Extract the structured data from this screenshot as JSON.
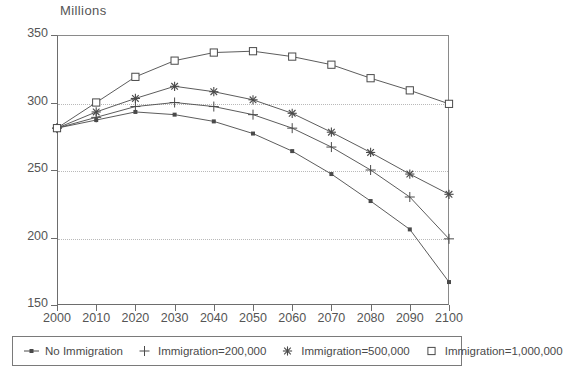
{
  "chart_data": {
    "type": "line",
    "title": "",
    "ylabel": "Millions",
    "xlabel": "",
    "x": [
      2000,
      2010,
      2020,
      2030,
      2040,
      2050,
      2060,
      2070,
      2080,
      2090,
      2100
    ],
    "xlim": [
      2000,
      2100
    ],
    "ylim": [
      150,
      350
    ],
    "yticks": [
      150,
      200,
      250,
      300,
      350
    ],
    "xticks": [
      2000,
      2010,
      2020,
      2030,
      2040,
      2050,
      2060,
      2070,
      2080,
      2090,
      2100
    ],
    "grid": "horizontal-dotted",
    "legend_position": "bottom",
    "series": [
      {
        "name": "No Immigration",
        "marker": "filled-square",
        "values": [
          281,
          287,
          293,
          291,
          286,
          277,
          264,
          247,
          227,
          206,
          167
        ]
      },
      {
        "name": "Immigration=200,000",
        "marker": "plus",
        "values": [
          281,
          289,
          297,
          300,
          297,
          291,
          281,
          267,
          250,
          230,
          199
        ]
      },
      {
        "name": "Immigration=500,000",
        "marker": "asterisk",
        "values": [
          281,
          293,
          303,
          312,
          308,
          302,
          292,
          278,
          263,
          247,
          232
        ]
      },
      {
        "name": "Immigration=1,000,000",
        "marker": "open-square",
        "values": [
          281,
          300,
          319,
          331,
          337,
          338,
          334,
          328,
          318,
          309,
          299
        ]
      }
    ]
  },
  "ylabel_title": "Millions",
  "legend": {
    "items": [
      {
        "label": "No Immigration",
        "marker": "filled-square"
      },
      {
        "label": "Immigration=200,000",
        "marker": "plus"
      },
      {
        "label": "Immigration=500,000",
        "marker": "asterisk"
      },
      {
        "label": "Immigration=1,000,000",
        "marker": "open-square"
      }
    ]
  }
}
